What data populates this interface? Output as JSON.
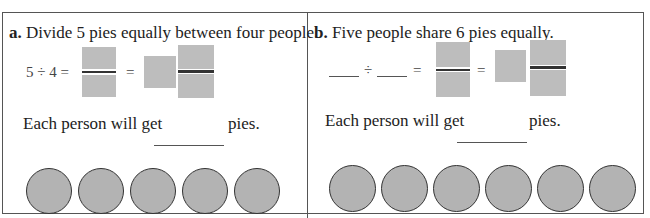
{
  "header_fragment": "b. Fill in",
  "problems": [
    {
      "letter": "a.",
      "prompt": "Divide 5 pies equally between four people.",
      "equation": {
        "dividend": "5",
        "divisor": "4",
        "div_sign": "÷",
        "equals": "="
      },
      "answer_prefix": "Each person will get",
      "answer_suffix": "pies.",
      "pie_count": 5
    },
    {
      "letter": "b.",
      "prompt": "Five people share 6 pies equally.",
      "equation": {
        "dividend": "",
        "divisor": "",
        "div_sign": "÷",
        "equals": "="
      },
      "answer_prefix": "Each person will get",
      "answer_suffix": "pies.",
      "pie_count": 6
    }
  ],
  "colors": {
    "answer_box": "#bdbdbd",
    "pie_fill": "#b3b3b3",
    "border": "#555555"
  }
}
